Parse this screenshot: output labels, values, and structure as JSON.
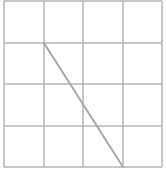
{
  "diagram": {
    "type": "grid-with-segment",
    "background": "#ffffff",
    "grid": {
      "columns": 4,
      "rows": 4,
      "x_lines": [
        4,
        44,
        83,
        123,
        162
      ],
      "y_lines": [
        1,
        43,
        84,
        126,
        167
      ],
      "line_color": "#b4b4b4",
      "line_width": 1.5
    },
    "segment": {
      "from_vertex": [
        1,
        1
      ],
      "to_vertex": [
        3,
        4
      ],
      "color": "#a8a8a8",
      "width": 2
    }
  }
}
